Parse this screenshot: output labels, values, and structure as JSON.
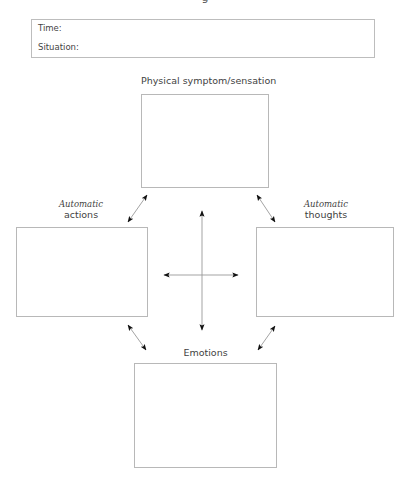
{
  "header": {
    "cutoff_title": "g"
  },
  "info_box": {
    "time_label": "Time:",
    "situation_label": "Situation:"
  },
  "nodes": {
    "physical": {
      "label": "Physical symptom/sensation"
    },
    "actions": {
      "qualifier": "Automatic",
      "label": "actions"
    },
    "thoughts": {
      "qualifier": "Automatic",
      "label": "thoughts"
    },
    "emotions": {
      "label": "Emotions"
    }
  },
  "connections": [
    {
      "from": "physical",
      "to": "actions",
      "type": "bidirectional"
    },
    {
      "from": "physical",
      "to": "thoughts",
      "type": "bidirectional"
    },
    {
      "from": "actions",
      "to": "emotions",
      "type": "bidirectional"
    },
    {
      "from": "thoughts",
      "to": "emotions",
      "type": "bidirectional"
    },
    {
      "from": "physical",
      "to": "emotions",
      "type": "bidirectional",
      "via": "center-cross"
    },
    {
      "from": "actions",
      "to": "thoughts",
      "type": "bidirectional",
      "via": "center-cross"
    }
  ]
}
